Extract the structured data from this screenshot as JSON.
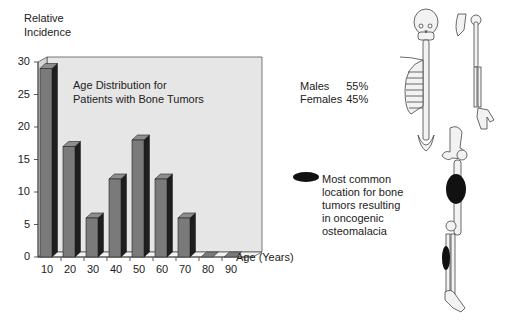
{
  "chart_data": {
    "type": "bar",
    "title": "Age Distribution for Patients with Bone Tumors",
    "xlabel": "Age (Years)",
    "ylabel": "Relative Incidence",
    "ylabel_lines": [
      "Relative",
      "Incidence"
    ],
    "title_lines": [
      "Age Distribution for",
      "Patients with Bone Tumors"
    ],
    "categories": [
      "10",
      "20",
      "30",
      "40",
      "50",
      "60",
      "70",
      "80",
      "90"
    ],
    "values": [
      29,
      17,
      6,
      12,
      18,
      12,
      6,
      0,
      0
    ],
    "yticks": [
      "0",
      "5",
      "10",
      "15",
      "20",
      "25",
      "30"
    ],
    "ylim": [
      0,
      30
    ],
    "grid": false,
    "legend": null,
    "style": "3d-bar"
  },
  "sex_distribution": {
    "rows": [
      {
        "label": "Males",
        "value": "55%"
      },
      {
        "label": "Females",
        "value": "45%"
      }
    ]
  },
  "annotation": {
    "marker": "black-ellipse",
    "lines": [
      "Most common",
      "location for bone",
      "tumors resulting",
      "in oncogenic",
      "osteomalacia"
    ]
  },
  "colors": {
    "bar_front": "#7a7a7a",
    "bar_side": "#1e1e1e",
    "bar_top": "#8d8d8d",
    "panel": "#e6e6e6",
    "marker": "#111111"
  }
}
